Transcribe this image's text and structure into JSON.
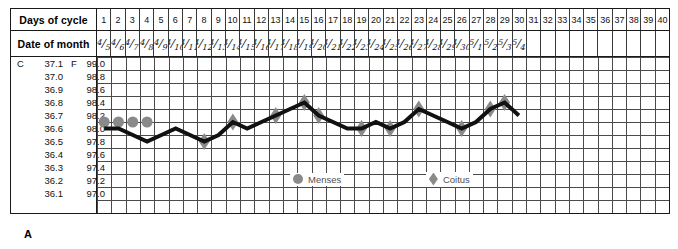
{
  "figure_label": "A",
  "table": {
    "days_row_label": "Days of cycle",
    "date_row_label": "Date of month"
  },
  "legend": {
    "menses": {
      "label": "Menses",
      "icon": "filled-circle",
      "color": "#8a8a8a"
    },
    "coitus": {
      "label": "Coitus",
      "icon": "filled-diamond",
      "color": "#8a8a8a"
    }
  },
  "axis": {
    "celsius_header": "C 37.1",
    "fahrenheit_header": "F 99.0",
    "celsius_ticks": [
      "37.1",
      "37.0",
      "36.9",
      "36.8",
      "36.7",
      "36.6",
      "36.5",
      "36.4",
      "36.3",
      "36.2",
      "36.1"
    ],
    "fahrenheit_ticks": [
      "99.0",
      "98.8",
      "98.6",
      "98.4",
      "98.2",
      "98.0",
      "97.8",
      "97.6",
      "97.4",
      "97.2",
      "97.0"
    ]
  },
  "chart_data": {
    "type": "line",
    "xlabel": "Days of cycle",
    "ylabel": "Basal body temperature",
    "grid": true,
    "legend_position": "bottom-center",
    "line_color": "#111111",
    "x": [
      1,
      2,
      3,
      4,
      5,
      6,
      7,
      8,
      9,
      10,
      11,
      12,
      13,
      14,
      15,
      16,
      17,
      18,
      19,
      20,
      21,
      22,
      23,
      24,
      25,
      26,
      27,
      28,
      29,
      30,
      31,
      32,
      33,
      34,
      35,
      36,
      37,
      38,
      39,
      40
    ],
    "days_of_cycle": [
      "1",
      "2",
      "3",
      "4",
      "5",
      "6",
      "7",
      "8",
      "9",
      "10",
      "11",
      "12",
      "13",
      "14",
      "15",
      "16",
      "17",
      "18",
      "19",
      "20",
      "21",
      "22",
      "23",
      "24",
      "25",
      "26",
      "27",
      "28",
      "29",
      "30",
      "31",
      "32",
      "33",
      "34",
      "35",
      "36",
      "37",
      "38",
      "39",
      "40"
    ],
    "date_of_month": [
      {
        "m": "4",
        "d": "5"
      },
      {
        "m": "4",
        "d": "6"
      },
      {
        "m": "4",
        "d": "7"
      },
      {
        "m": "4",
        "d": "8"
      },
      {
        "m": "4",
        "d": "9"
      },
      {
        "m": "4",
        "d": "10"
      },
      {
        "m": "4",
        "d": "11"
      },
      {
        "m": "4",
        "d": "12"
      },
      {
        "m": "4",
        "d": "13"
      },
      {
        "m": "4",
        "d": "14"
      },
      {
        "m": "4",
        "d": "15"
      },
      {
        "m": "4",
        "d": "16"
      },
      {
        "m": "4",
        "d": "17"
      },
      {
        "m": "4",
        "d": "18"
      },
      {
        "m": "4",
        "d": "19"
      },
      {
        "m": "4",
        "d": "20"
      },
      {
        "m": "4",
        "d": "21"
      },
      {
        "m": "4",
        "d": "22"
      },
      {
        "m": "4",
        "d": "23"
      },
      {
        "m": "4",
        "d": "24"
      },
      {
        "m": "4",
        "d": "25"
      },
      {
        "m": "4",
        "d": "26"
      },
      {
        "m": "4",
        "d": "27"
      },
      {
        "m": "4",
        "d": "28"
      },
      {
        "m": "4",
        "d": "29"
      },
      {
        "m": "4",
        "d": "30"
      },
      {
        "m": "5",
        "d": "1"
      },
      {
        "m": "5",
        "d": "2"
      },
      {
        "m": "5",
        "d": "3"
      },
      {
        "m": "5",
        "d": "4"
      },
      null,
      null,
      null,
      null,
      null,
      null,
      null,
      null,
      null,
      null
    ],
    "ylim_f": [
      97.0,
      99.0
    ],
    "ylim_c": [
      36.1,
      37.1
    ],
    "series": [
      {
        "name": "Basal body temperature (F)",
        "values": [
          98.0,
          98.0,
          97.9,
          97.8,
          97.9,
          98.0,
          97.9,
          97.8,
          97.9,
          98.1,
          98.0,
          98.1,
          98.2,
          98.3,
          98.4,
          98.2,
          98.1,
          98.0,
          98.0,
          98.1,
          98.0,
          98.1,
          98.3,
          98.2,
          98.1,
          98.0,
          98.1,
          98.3,
          98.4,
          98.2,
          null,
          null,
          null,
          null,
          null,
          null,
          null,
          null,
          null,
          null
        ]
      }
    ],
    "menses_days": [
      1,
      2,
      3,
      4
    ],
    "menses_marker_value": 98.1,
    "coitus_days": [
      8,
      10,
      13,
      15,
      16,
      19,
      21,
      23,
      26,
      28,
      29
    ]
  }
}
